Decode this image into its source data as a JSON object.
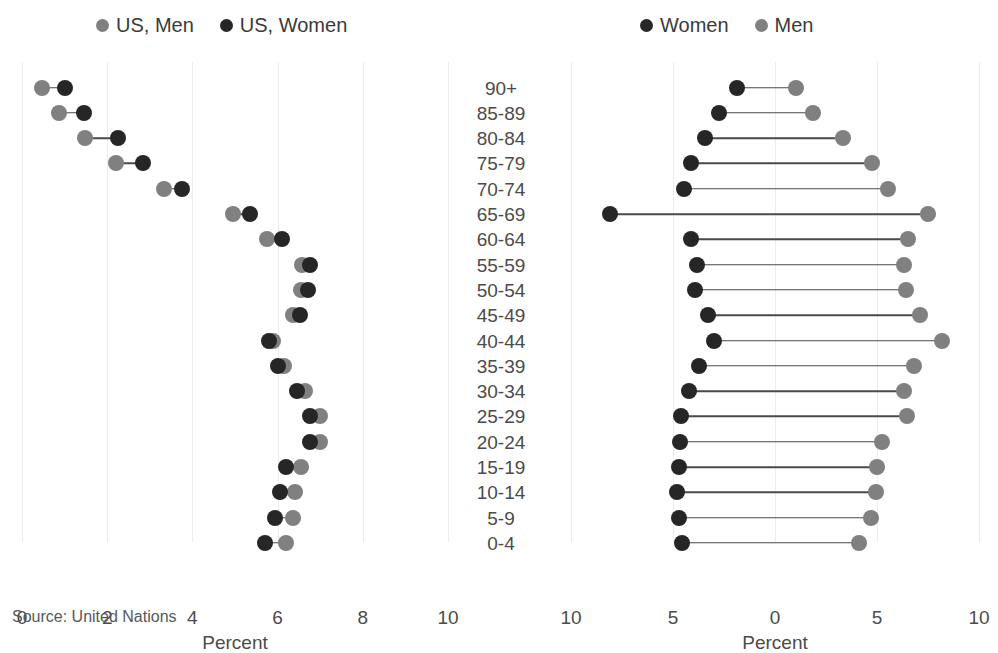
{
  "colors": {
    "women": "#262626",
    "men": "#808080",
    "connector": "#4a4a4a",
    "gridline": "#ededed",
    "text": "#4b4b4b",
    "background": "#ffffff"
  },
  "left_panel": {
    "legend": [
      {
        "label": "US, Men",
        "color_key": "men",
        "icon": "legend-dot-gray"
      },
      {
        "label": "US, Women",
        "color_key": "women",
        "icon": "legend-dot-dark"
      }
    ],
    "axis_title": "Percent",
    "ticks": [
      {
        "label": "0",
        "value": 0
      },
      {
        "label": "2",
        "value": 2
      },
      {
        "label": "4",
        "value": 4
      },
      {
        "label": "6",
        "value": 6
      },
      {
        "label": "8",
        "value": 8
      },
      {
        "label": "10",
        "value": 10
      }
    ]
  },
  "right_panel": {
    "legend": [
      {
        "label": "Women",
        "color_key": "women",
        "icon": "legend-dot-dark"
      },
      {
        "label": "Men",
        "color_key": "men",
        "icon": "legend-dot-gray"
      }
    ],
    "axis_title": "Percent",
    "ticks": [
      {
        "label": "10",
        "value": -10
      },
      {
        "label": "5",
        "value": -5
      },
      {
        "label": "0",
        "value": 0
      },
      {
        "label": "5",
        "value": 5
      },
      {
        "label": "10",
        "value": 10
      }
    ]
  },
  "source_note": "Source: United Nations",
  "chart_data": [
    {
      "id": "us-dumbbell",
      "type": "scatter",
      "subtype": "dumbbell",
      "title": "",
      "xlabel": "Percent",
      "ylabel": "",
      "xlim": [
        0,
        10
      ],
      "grid": true,
      "legend_position": "top",
      "categories": [
        "90+",
        "85-89",
        "80-84",
        "75-79",
        "70-74",
        "65-69",
        "60-64",
        "55-59",
        "50-54",
        "45-49",
        "40-44",
        "35-39",
        "30-34",
        "25-29",
        "20-24",
        "15-19",
        "10-14",
        "5-9",
        "0-4"
      ],
      "series": [
        {
          "name": "US, Men",
          "color": "#808080",
          "values": [
            0.47,
            0.87,
            1.48,
            2.2,
            3.33,
            4.95,
            5.75,
            6.58,
            6.55,
            6.35,
            5.9,
            6.15,
            6.65,
            7.0,
            7.0,
            6.55,
            6.4,
            6.35,
            6.2
          ]
        },
        {
          "name": "US, Women",
          "color": "#262626",
          "values": [
            1.02,
            1.45,
            2.25,
            2.85,
            3.75,
            5.35,
            6.1,
            6.75,
            6.72,
            6.52,
            5.8,
            6.0,
            6.45,
            6.75,
            6.75,
            6.2,
            6.05,
            5.95,
            5.7
          ]
        }
      ]
    },
    {
      "id": "world-pyramid",
      "type": "scatter",
      "subtype": "dumbbell",
      "title": "",
      "xlabel": "Percent",
      "ylabel": "",
      "xlim": [
        -10,
        10
      ],
      "grid": true,
      "legend_position": "top",
      "categories": [
        "90+",
        "85-89",
        "80-84",
        "75-79",
        "70-74",
        "65-69",
        "60-64",
        "55-59",
        "50-54",
        "45-49",
        "40-44",
        "35-39",
        "30-34",
        "25-29",
        "20-24",
        "15-19",
        "10-14",
        "5-9",
        "0-4"
      ],
      "series": [
        {
          "name": "Women",
          "color": "#262626",
          "values": [
            1.85,
            2.75,
            3.45,
            4.1,
            4.45,
            8.1,
            4.1,
            3.8,
            3.9,
            3.3,
            3.0,
            3.75,
            4.2,
            4.6,
            4.65,
            4.7,
            4.8,
            4.7,
            4.55
          ]
        },
        {
          "name": "Men",
          "color": "#808080",
          "values": [
            1.05,
            1.85,
            3.35,
            4.75,
            5.55,
            7.5,
            6.5,
            6.3,
            6.4,
            7.1,
            8.2,
            6.8,
            6.3,
            6.45,
            5.25,
            5.0,
            4.95,
            4.7,
            4.1
          ]
        }
      ]
    }
  ]
}
